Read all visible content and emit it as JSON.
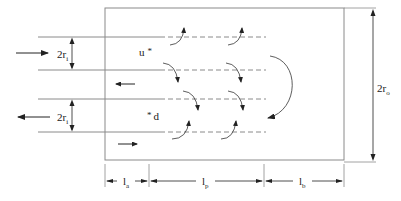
{
  "diagram": {
    "labels": {
      "inlet_radius_top": "2r",
      "inlet_radius_top_sub": "i",
      "inlet_radius_bottom": "2r",
      "inlet_radius_bottom_sub": "i",
      "outer_radius": "2r",
      "outer_radius_sub": "o",
      "upstream_point": "u",
      "downstream_point": "d",
      "star": "*",
      "len_a": "l",
      "len_a_sub": "a",
      "len_p": "l",
      "len_p_sub": "p",
      "len_b": "l",
      "len_b_sub": "b"
    },
    "colors": {
      "line": "#8a8a8a",
      "arrow": "#222222"
    }
  }
}
